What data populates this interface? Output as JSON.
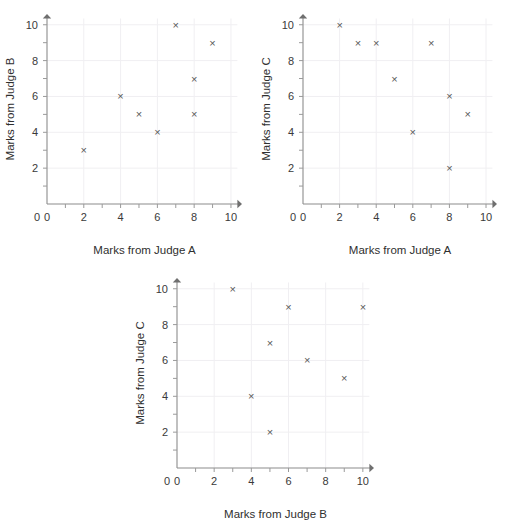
{
  "page": {
    "background": "#ffffff",
    "marker_glyph": "×",
    "marker_color": "#585858",
    "axis_color": "#8c8c8c",
    "grid_color": "#f0eff2",
    "text_color": "#2f2f2f"
  },
  "chart_data": [
    {
      "id": "scatter-judge-a-vs-b",
      "type": "scatter",
      "title": "",
      "xlabel": "Marks from Judge A",
      "ylabel": "Marks from Judge B",
      "xlim": [
        0,
        10.6
      ],
      "ylim": [
        0,
        10.6
      ],
      "xticks": [
        0,
        1,
        2,
        3,
        4,
        5,
        6,
        7,
        8,
        9,
        10
      ],
      "yticks": [
        0,
        1,
        2,
        3,
        4,
        5,
        6,
        7,
        8,
        9,
        10
      ],
      "xtick_labels": [
        {
          "value": 0,
          "label": "0"
        },
        {
          "value": 2,
          "label": "2"
        },
        {
          "value": 4,
          "label": "4"
        },
        {
          "value": 6,
          "label": "6"
        },
        {
          "value": 8,
          "label": "8"
        },
        {
          "value": 10,
          "label": "10"
        }
      ],
      "ytick_labels": [
        {
          "value": 0,
          "label": "0"
        },
        {
          "value": 2,
          "label": "2"
        },
        {
          "value": 4,
          "label": "4"
        },
        {
          "value": 6,
          "label": "6"
        },
        {
          "value": 8,
          "label": "8"
        },
        {
          "value": 10,
          "label": "10"
        }
      ],
      "gridlines_x": [
        2,
        4,
        6,
        8,
        10
      ],
      "gridlines_y": [
        2,
        4,
        6,
        8,
        10
      ],
      "grid": true,
      "legend": "none",
      "points": [
        {
          "x": 2,
          "y": 3
        },
        {
          "x": 4,
          "y": 6
        },
        {
          "x": 5,
          "y": 5
        },
        {
          "x": 6,
          "y": 4
        },
        {
          "x": 7,
          "y": 10
        },
        {
          "x": 8,
          "y": 7
        },
        {
          "x": 8,
          "y": 5
        },
        {
          "x": 9,
          "y": 9
        }
      ]
    },
    {
      "id": "scatter-judge-a-vs-c",
      "type": "scatter",
      "title": "",
      "xlabel": "Marks from Judge A",
      "ylabel": "Marks from Judge C",
      "xlim": [
        0,
        10.6
      ],
      "ylim": [
        0,
        10.6
      ],
      "xticks": [
        0,
        1,
        2,
        3,
        4,
        5,
        6,
        7,
        8,
        9,
        10
      ],
      "yticks": [
        0,
        1,
        2,
        3,
        4,
        5,
        6,
        7,
        8,
        9,
        10
      ],
      "xtick_labels": [
        {
          "value": 0,
          "label": "0"
        },
        {
          "value": 2,
          "label": "2"
        },
        {
          "value": 4,
          "label": "4"
        },
        {
          "value": 6,
          "label": "6"
        },
        {
          "value": 8,
          "label": "8"
        },
        {
          "value": 10,
          "label": "10"
        }
      ],
      "ytick_labels": [
        {
          "value": 0,
          "label": "0"
        },
        {
          "value": 2,
          "label": "2"
        },
        {
          "value": 4,
          "label": "4"
        },
        {
          "value": 6,
          "label": "6"
        },
        {
          "value": 8,
          "label": "8"
        },
        {
          "value": 10,
          "label": "10"
        }
      ],
      "gridlines_x": [
        2,
        4,
        6,
        8,
        10
      ],
      "gridlines_y": [
        2,
        4,
        6,
        8,
        10
      ],
      "grid": true,
      "legend": "none",
      "points": [
        {
          "x": 2,
          "y": 10
        },
        {
          "x": 3,
          "y": 9
        },
        {
          "x": 4,
          "y": 9
        },
        {
          "x": 5,
          "y": 7
        },
        {
          "x": 6,
          "y": 4
        },
        {
          "x": 7,
          "y": 9
        },
        {
          "x": 8,
          "y": 6
        },
        {
          "x": 8,
          "y": 2
        },
        {
          "x": 9,
          "y": 5
        }
      ]
    },
    {
      "id": "scatter-judge-b-vs-c",
      "type": "scatter",
      "title": "",
      "xlabel": "Marks from Judge B",
      "ylabel": "Marks from Judge C",
      "xlim": [
        0,
        10.6
      ],
      "ylim": [
        0,
        10.6
      ],
      "xticks": [
        0,
        1,
        2,
        3,
        4,
        5,
        6,
        7,
        8,
        9,
        10
      ],
      "yticks": [
        0,
        1,
        2,
        3,
        4,
        5,
        6,
        7,
        8,
        9,
        10
      ],
      "xtick_labels": [
        {
          "value": 0,
          "label": "0"
        },
        {
          "value": 2,
          "label": "2"
        },
        {
          "value": 4,
          "label": "4"
        },
        {
          "value": 6,
          "label": "6"
        },
        {
          "value": 8,
          "label": "8"
        },
        {
          "value": 10,
          "label": "10"
        }
      ],
      "ytick_labels": [
        {
          "value": 0,
          "label": "0"
        },
        {
          "value": 2,
          "label": "2"
        },
        {
          "value": 4,
          "label": "4"
        },
        {
          "value": 6,
          "label": "6"
        },
        {
          "value": 8,
          "label": "8"
        },
        {
          "value": 10,
          "label": "10"
        }
      ],
      "gridlines_x": [
        2,
        4,
        6,
        8,
        10
      ],
      "gridlines_y": [
        2,
        4,
        6,
        8,
        10
      ],
      "grid": true,
      "legend": "none",
      "points": [
        {
          "x": 3,
          "y": 10
        },
        {
          "x": 4,
          "y": 4
        },
        {
          "x": 5,
          "y": 7
        },
        {
          "x": 5,
          "y": 2
        },
        {
          "x": 6,
          "y": 9
        },
        {
          "x": 7,
          "y": 6
        },
        {
          "x": 9,
          "y": 5
        },
        {
          "x": 10,
          "y": 9
        }
      ]
    }
  ]
}
